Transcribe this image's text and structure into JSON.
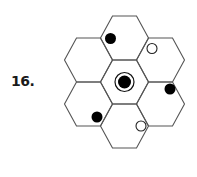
{
  "problem": {
    "number_label": "16."
  },
  "diagram": {
    "hex_radius": 24,
    "hex_half_height": 22,
    "stroke_color": "#555555",
    "hexes": [
      {
        "id": "center",
        "cx": 124.5,
        "cy": 82
      },
      {
        "id": "top",
        "cx": 124.5,
        "cy": 38
      },
      {
        "id": "bottom",
        "cx": 124.5,
        "cy": 126
      },
      {
        "id": "upper-left",
        "cx": 88.5,
        "cy": 60
      },
      {
        "id": "lower-left",
        "cx": 88.5,
        "cy": 104
      },
      {
        "id": "upper-right",
        "cx": 160.5,
        "cy": 60
      },
      {
        "id": "lower-right",
        "cx": 160.5,
        "cy": 104
      }
    ],
    "center_marker": {
      "cx": 124.5,
      "cy": 82,
      "ring_r": 9.5,
      "dot_r": 6.5
    },
    "dots": [
      {
        "type": "filled",
        "cx": 110.5,
        "cy": 38.5,
        "r": 5.5
      },
      {
        "type": "open",
        "cx": 152,
        "cy": 48.5,
        "r": 5
      },
      {
        "type": "filled",
        "cx": 170,
        "cy": 89,
        "r": 5.5
      },
      {
        "type": "filled",
        "cx": 97,
        "cy": 117,
        "r": 5.5
      },
      {
        "type": "open",
        "cx": 141,
        "cy": 126,
        "r": 5
      }
    ]
  }
}
